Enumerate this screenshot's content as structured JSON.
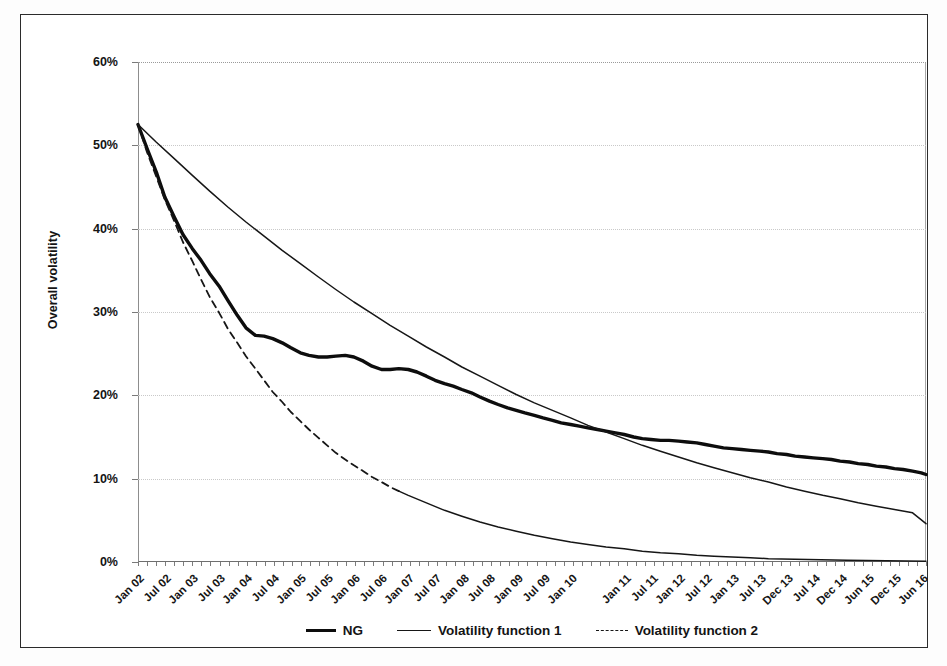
{
  "chart_data": {
    "type": "line",
    "title": "",
    "xlabel": "",
    "ylabel": "Overall volatility",
    "ylim": [
      0,
      60
    ],
    "yunit": "%",
    "grid": true,
    "legend_position": "bottom",
    "y_ticks": [
      {
        "value": 60,
        "label": "60%"
      },
      {
        "value": 50,
        "label": "50%"
      },
      {
        "value": 40,
        "label": "40%"
      },
      {
        "value": 30,
        "label": "30%"
      },
      {
        "value": 20,
        "label": "20%"
      },
      {
        "value": 10,
        "label": "10%"
      },
      {
        "value": 0,
        "label": "0%"
      }
    ],
    "x_tick_labels": [
      "Jan 02",
      "Jul 02",
      "Jan 03",
      "Jul 03",
      "Jan 04",
      "Jul 04",
      "Jan 05",
      "Jul 05",
      "Jan 06",
      "Jul 06",
      "Jan 07",
      "Jul 07",
      "Jan 08",
      "Jul 08",
      "Jan 09",
      "Jul 09",
      "Jan 10",
      "Jan 11",
      "Jul 11",
      "Jan 12",
      "Jul 12",
      "Jan 13",
      "Jul 13",
      "Dec 13",
      "Jul 14",
      "Dec 14",
      "Jun 15",
      "Dec 15",
      "Jun 16"
    ],
    "x_tick_positions_pct": [
      0.0,
      3.4,
      6.85,
      10.3,
      13.7,
      17.15,
      20.6,
      24.0,
      27.45,
      30.9,
      34.3,
      37.75,
      41.2,
      44.6,
      48.05,
      51.5,
      54.9,
      61.8,
      65.2,
      68.65,
      72.1,
      75.5,
      78.95,
      82.4,
      85.8,
      89.25,
      92.7,
      96.1,
      99.5
    ],
    "series": [
      {
        "name": "NG",
        "style": "thick-solid",
        "color": "#0d0d0d",
        "x_pct": [
          0,
          1.2,
          2.4,
          3.4,
          4.6,
          5.7,
          6.9,
          8.0,
          9.1,
          10.3,
          11.4,
          12.6,
          13.7,
          14.9,
          16.0,
          17.1,
          18.3,
          19.4,
          20.6,
          21.7,
          22.9,
          24.0,
          25.1,
          26.3,
          27.4,
          28.6,
          29.7,
          30.9,
          32.0,
          33.1,
          34.3,
          35.4,
          36.6,
          37.7,
          38.9,
          40.0,
          41.1,
          42.3,
          43.4,
          44.6,
          45.7,
          46.9,
          48.0,
          49.1,
          50.3,
          51.4,
          52.6,
          53.7,
          54.9,
          56.0,
          57.1,
          58.3,
          59.4,
          60.6,
          61.7,
          62.9,
          64.0,
          65.1,
          66.3,
          67.4,
          68.6,
          69.7,
          70.9,
          72.0,
          73.1,
          74.3,
          75.4,
          76.6,
          77.7,
          78.9,
          80.0,
          81.1,
          82.3,
          83.4,
          84.6,
          85.7,
          86.9,
          88.0,
          89.1,
          90.3,
          91.4,
          92.6,
          93.7,
          94.9,
          96.0,
          97.1,
          98.3,
          99.4,
          100.0
        ],
        "y_pct": [
          52.5,
          49.5,
          46.6,
          43.8,
          41.4,
          39.3,
          37.6,
          36.2,
          34.6,
          33.1,
          31.4,
          29.6,
          28.1,
          27.2,
          27.1,
          26.8,
          26.3,
          25.7,
          25.1,
          24.8,
          24.6,
          24.6,
          24.7,
          24.8,
          24.6,
          24.1,
          23.5,
          23.1,
          23.1,
          23.2,
          23.1,
          22.8,
          22.3,
          21.8,
          21.4,
          21.1,
          20.7,
          20.3,
          19.8,
          19.3,
          18.9,
          18.5,
          18.2,
          17.9,
          17.6,
          17.3,
          17.0,
          16.7,
          16.5,
          16.3,
          16.1,
          15.9,
          15.7,
          15.5,
          15.3,
          15.0,
          14.8,
          14.7,
          14.6,
          14.6,
          14.5,
          14.4,
          14.3,
          14.1,
          13.9,
          13.7,
          13.6,
          13.5,
          13.4,
          13.3,
          13.2,
          13.0,
          12.9,
          12.7,
          12.6,
          12.5,
          12.4,
          12.3,
          12.1,
          12.0,
          11.8,
          11.7,
          11.5,
          11.4,
          11.2,
          11.1,
          10.9,
          10.7,
          10.5
        ]
      },
      {
        "name": "Volatility function 1",
        "style": "thin-solid",
        "color": "#161616",
        "x_pct": [
          0,
          2.3,
          4.6,
          6.9,
          9.1,
          11.4,
          13.7,
          16.0,
          18.3,
          20.6,
          22.9,
          25.1,
          27.4,
          29.7,
          32.0,
          34.3,
          36.6,
          38.9,
          41.1,
          43.4,
          45.7,
          48.0,
          50.3,
          52.6,
          54.9,
          57.1,
          59.4,
          61.7,
          64.0,
          66.3,
          68.6,
          70.9,
          73.1,
          75.4,
          77.7,
          80.0,
          82.3,
          84.6,
          86.9,
          89.1,
          91.4,
          93.7,
          96.0,
          98.3,
          100.0
        ],
        "y_pct": [
          52.5,
          50.4,
          48.4,
          46.4,
          44.5,
          42.6,
          40.8,
          39.1,
          37.4,
          35.8,
          34.2,
          32.7,
          31.2,
          29.8,
          28.4,
          27.1,
          25.8,
          24.6,
          23.4,
          22.3,
          21.2,
          20.1,
          19.1,
          18.2,
          17.3,
          16.4,
          15.6,
          14.8,
          14.0,
          13.3,
          12.6,
          11.9,
          11.3,
          10.7,
          10.1,
          9.6,
          9.0,
          8.5,
          8.0,
          7.6,
          7.1,
          6.7,
          6.3,
          5.9,
          4.6
        ]
      },
      {
        "name": "Volatility function 2",
        "style": "dashed",
        "color": "#161616",
        "x_pct": [
          0,
          1.1,
          2.3,
          3.4,
          4.6,
          5.7,
          6.9,
          8.0,
          9.1,
          10.3,
          11.4,
          12.6,
          13.7,
          14.9,
          16.0,
          17.1,
          18.3,
          19.4,
          20.6,
          21.7,
          22.9,
          24.0,
          25.1,
          26.3,
          27.4,
          28.6,
          29.7,
          30.9,
          32.0,
          33.1,
          34.3,
          36.6,
          38.9,
          41.1,
          43.4,
          45.7,
          48.0,
          50.3,
          52.6,
          54.9,
          57.1,
          59.4,
          61.7,
          64.0,
          66.3,
          68.6,
          70.9,
          73.1,
          75.4,
          77.7,
          80.0,
          85.0,
          90.0,
          95.0,
          100.0
        ],
        "y_pct": [
          52.5,
          49.3,
          46.3,
          43.5,
          40.9,
          38.4,
          36.1,
          33.9,
          31.8,
          29.9,
          28.0,
          26.3,
          24.7,
          23.2,
          21.8,
          20.4,
          19.2,
          18.0,
          16.9,
          15.9,
          14.9,
          14.0,
          13.1,
          12.3,
          11.6,
          10.9,
          10.2,
          9.6,
          9.0,
          8.5,
          8.0,
          7.1,
          6.2,
          5.5,
          4.8,
          4.2,
          3.7,
          3.2,
          2.8,
          2.4,
          2.1,
          1.8,
          1.6,
          1.3,
          1.1,
          1.0,
          0.8,
          0.7,
          0.6,
          0.5,
          0.4,
          0.3,
          0.2,
          0.15,
          0.1
        ],
        "dash_until_pct": 33.1
      }
    ],
    "legend": [
      {
        "label": "NG",
        "style": "thick"
      },
      {
        "label": "Volatility function 1",
        "style": "thin"
      },
      {
        "label": "Volatility function 2",
        "style": "dashed"
      }
    ]
  }
}
